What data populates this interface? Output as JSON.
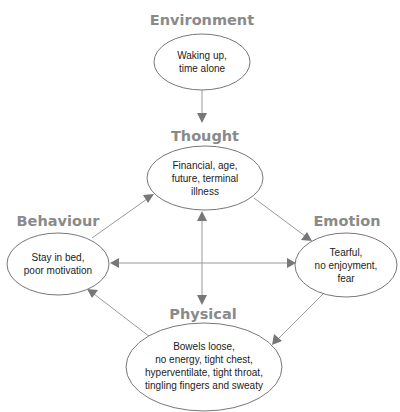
{
  "diagram": {
    "type": "cognitive-behavioural-cycle",
    "nodes": [
      {
        "id": "environment",
        "header": "Environment",
        "lines": [
          "Waking up,",
          "time alone"
        ]
      },
      {
        "id": "thought",
        "header": "Thought",
        "lines": [
          "Financial, age,",
          "future, terminal",
          "illness"
        ]
      },
      {
        "id": "behaviour",
        "header": "Behaviour",
        "lines": [
          "Stay in bed,",
          "poor motivation"
        ]
      },
      {
        "id": "emotion",
        "header": "Emotion",
        "lines": [
          "Tearful,",
          "no enjoyment,",
          "fear"
        ]
      },
      {
        "id": "physical",
        "header": "Physical",
        "lines": [
          "Bowels loose,",
          "no energy, tight chest,",
          "hyperventilate, tight throat,",
          "tingling fingers and sweaty"
        ]
      }
    ],
    "edges": [
      {
        "from": "environment",
        "to": "thought",
        "direction": "forward"
      },
      {
        "from": "behaviour",
        "to": "thought",
        "direction": "forward"
      },
      {
        "from": "thought",
        "to": "emotion",
        "direction": "forward"
      },
      {
        "from": "emotion",
        "to": "physical",
        "direction": "forward"
      },
      {
        "from": "physical",
        "to": "behaviour",
        "direction": "forward"
      },
      {
        "from": "thought",
        "to": "physical",
        "direction": "both"
      },
      {
        "from": "behaviour",
        "to": "emotion",
        "direction": "both"
      }
    ],
    "colors": {
      "header": "#8a8a8a",
      "stroke": "#777777",
      "line": "#999999",
      "text": "#222222"
    }
  }
}
